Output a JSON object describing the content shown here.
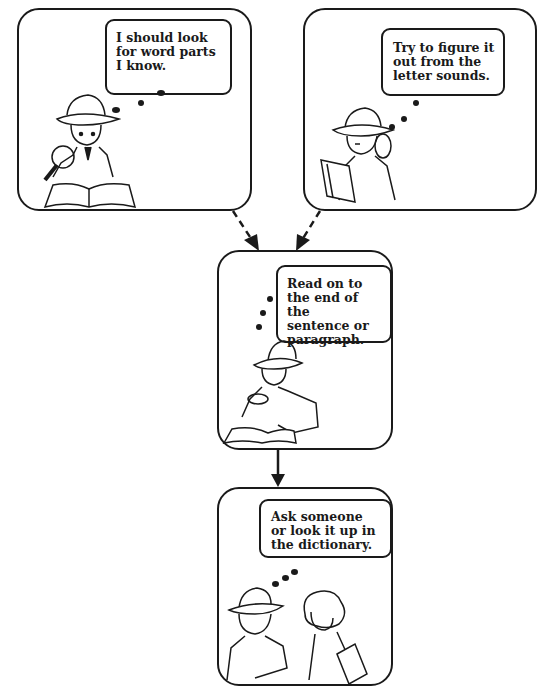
{
  "diagram": {
    "type": "flowchart",
    "title": "",
    "nodes": [
      {
        "id": "word-parts",
        "text": "I should look\nfor word parts\nI know.",
        "figure": "detective reading book with magnifying glass"
      },
      {
        "id": "letter-sounds",
        "text": "Try to figure it\nout from the\nletter sounds.",
        "figure": "detective holding book and magnifying glass, thinking"
      },
      {
        "id": "read-on",
        "text": "Read on to\nthe end of the\nsentence or\nparagraph.",
        "figure": "detective examining book with magnifying glass"
      },
      {
        "id": "ask-someone",
        "text": "Ask someone\nor look it up in\nthe dictionary.",
        "figure": "detective talking to girl holding a book"
      }
    ],
    "edges": [
      {
        "from": "word-parts",
        "to": "read-on",
        "style": "dashed"
      },
      {
        "from": "letter-sounds",
        "to": "read-on",
        "style": "dashed"
      },
      {
        "from": "read-on",
        "to": "ask-someone",
        "style": "solid"
      }
    ]
  },
  "colors": {
    "line": "#1a1a1a",
    "background": "#ffffff"
  }
}
